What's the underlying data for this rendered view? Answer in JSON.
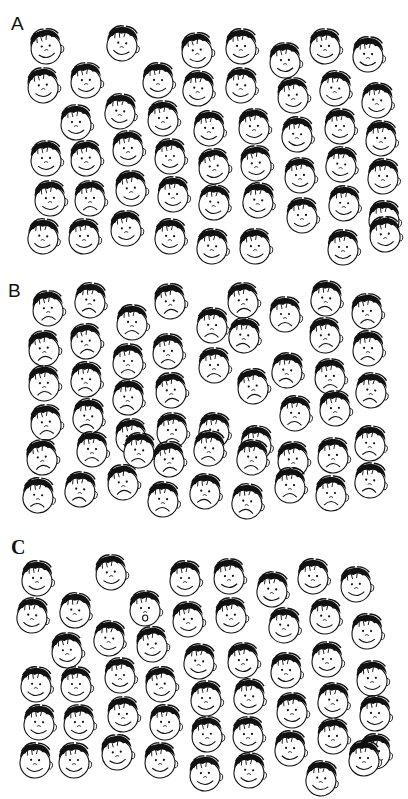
{
  "figure": {
    "panels": [
      {
        "id": "A",
        "label": "A",
        "label_style": "sans",
        "label_pos": [
          11,
          14
        ],
        "top": 0,
        "crowd_expression": "happy",
        "target_expression": "sad",
        "target_index": 33,
        "faces": [
          [
            46,
            48
          ],
          [
            122,
            45
          ],
          [
            197,
            52
          ],
          [
            241,
            48
          ],
          [
            285,
            62
          ],
          [
            325,
            48
          ],
          [
            368,
            56
          ],
          [
            43,
            87
          ],
          [
            86,
            82
          ],
          [
            158,
            82
          ],
          [
            198,
            90
          ],
          [
            241,
            87
          ],
          [
            293,
            97
          ],
          [
            335,
            90
          ],
          [
            377,
            102
          ],
          [
            76,
            124
          ],
          [
            120,
            113
          ],
          [
            163,
            120
          ],
          [
            209,
            130
          ],
          [
            254,
            128
          ],
          [
            297,
            136
          ],
          [
            340,
            128
          ],
          [
            381,
            140
          ],
          [
            46,
            160
          ],
          [
            86,
            160
          ],
          [
            128,
            150
          ],
          [
            170,
            158
          ],
          [
            214,
            168
          ],
          [
            256,
            165
          ],
          [
            300,
            177
          ],
          [
            341,
            166
          ],
          [
            383,
            178
          ],
          [
            50,
            200
          ],
          [
            90,
            200
          ],
          [
            131,
            190
          ],
          [
            173,
            196
          ],
          [
            214,
            204
          ],
          [
            258,
            202
          ],
          [
            302,
            217
          ],
          [
            344,
            205
          ],
          [
            384,
            220
          ],
          [
            43,
            238
          ],
          [
            84,
            238
          ],
          [
            126,
            230
          ],
          [
            170,
            238
          ],
          [
            212,
            248
          ],
          [
            255,
            248
          ],
          [
            343,
            249
          ],
          [
            385,
            236
          ]
        ],
        "face_count": 50
      },
      {
        "id": "B",
        "label": "B",
        "label_style": "sans",
        "label_pos": [
          8,
          281
        ],
        "top": 265,
        "crowd_expression": "sad",
        "target_expression": "happy",
        "target_index": 29,
        "faces": [
          [
            48,
            310
          ],
          [
            90,
            302
          ],
          [
            170,
            303
          ],
          [
            243,
            302
          ],
          [
            285,
            316
          ],
          [
            326,
            300
          ],
          [
            367,
            313
          ],
          [
            132,
            324
          ],
          [
            212,
            327
          ],
          [
            244,
            337
          ],
          [
            325,
            337
          ],
          [
            368,
            350
          ],
          [
            44,
            350
          ],
          [
            86,
            343
          ],
          [
            128,
            363
          ],
          [
            168,
            353
          ],
          [
            214,
            367
          ],
          [
            287,
            372
          ],
          [
            330,
            378
          ],
          [
            371,
            392
          ],
          [
            44,
            385
          ],
          [
            86,
            381
          ],
          [
            128,
            399
          ],
          [
            171,
            392
          ],
          [
            253,
            388
          ],
          [
            295,
            415
          ],
          [
            335,
            410
          ],
          [
            46,
            424
          ],
          [
            88,
            418
          ],
          [
            131,
            438
          ],
          [
            172,
            432
          ],
          [
            214,
            432
          ],
          [
            256,
            445
          ],
          [
            42,
            459
          ],
          [
            92,
            451
          ],
          [
            139,
            452
          ],
          [
            169,
            461
          ],
          [
            209,
            450
          ],
          [
            252,
            459
          ],
          [
            293,
            461
          ],
          [
            333,
            457
          ],
          [
            370,
            445
          ],
          [
            38,
            497
          ],
          [
            80,
            491
          ],
          [
            123,
            484
          ],
          [
            163,
            501
          ],
          [
            205,
            493
          ],
          [
            247,
            503
          ],
          [
            290,
            487
          ],
          [
            331,
            495
          ],
          [
            370,
            482
          ]
        ],
        "face_count": 50
      },
      {
        "id": "C",
        "label": "C",
        "label_style": "serif",
        "label_pos": [
          11,
          537
        ],
        "top": 530,
        "crowd_expression": "happy",
        "target_expression": "surprised",
        "target_index": 9,
        "faces": [
          [
            37,
            580
          ],
          [
            111,
            574
          ],
          [
            185,
            580
          ],
          [
            229,
            578
          ],
          [
            272,
            591
          ],
          [
            313,
            578
          ],
          [
            356,
            586
          ],
          [
            32,
            617
          ],
          [
            75,
            612
          ],
          [
            145,
            610
          ],
          [
            188,
            621
          ],
          [
            231,
            617
          ],
          [
            284,
            627
          ],
          [
            325,
            618
          ],
          [
            367,
            633
          ],
          [
            67,
            652
          ],
          [
            109,
            640
          ],
          [
            152,
            646
          ],
          [
            199,
            663
          ],
          [
            243,
            662
          ],
          [
            286,
            672
          ],
          [
            327,
            661
          ],
          [
            372,
            680
          ],
          [
            36,
            686
          ],
          [
            76,
            686
          ],
          [
            120,
            677
          ],
          [
            161,
            686
          ],
          [
            206,
            700
          ],
          [
            249,
            698
          ],
          [
            292,
            712
          ],
          [
            333,
            702
          ],
          [
            375,
            715
          ],
          [
            39,
            724
          ],
          [
            79,
            724
          ],
          [
            123,
            716
          ],
          [
            165,
            724
          ],
          [
            207,
            736
          ],
          [
            248,
            736
          ],
          [
            290,
            750
          ],
          [
            333,
            738
          ],
          [
            375,
            753
          ],
          [
            35,
            762
          ],
          [
            74,
            762
          ],
          [
            117,
            754
          ],
          [
            160,
            762
          ],
          [
            205,
            775
          ],
          [
            249,
            772
          ],
          [
            321,
            780
          ],
          [
            364,
            760
          ]
        ],
        "face_count": 50
      }
    ],
    "expressions": {
      "happy": "smile-arc",
      "sad": "frown-arc",
      "surprised": "o-mouth"
    },
    "colors": {
      "ink": "#111111",
      "background": "#ffffff"
    }
  }
}
